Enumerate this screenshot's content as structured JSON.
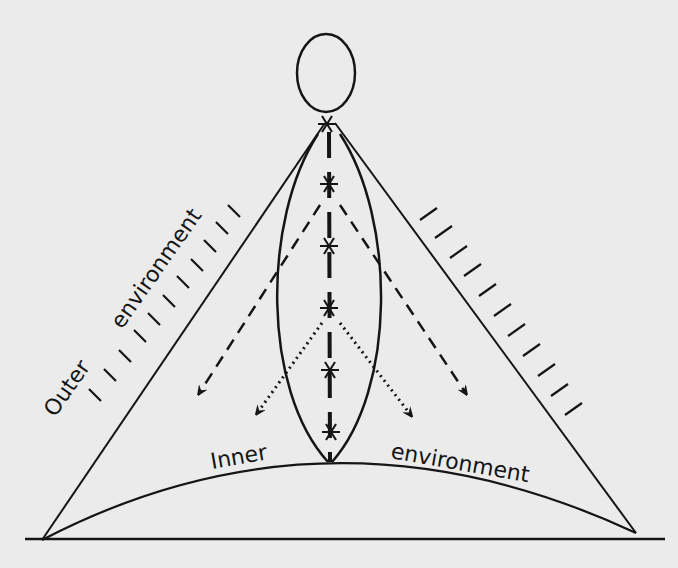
{
  "diagram": {
    "title": "",
    "labels": {
      "outer_word1": "Outer",
      "outer_word2": "environment",
      "inner_word1": "Inner",
      "inner_word2": "environment"
    },
    "elements": {
      "head": "head-ellipse",
      "spine": "vertical-axis-with-7-asterisk-nodes",
      "body": "lens-shaped-inner-body",
      "outer_boundary": "triangle-sides-with-hatching",
      "arrows_dashed": 2,
      "arrows_dotted": 2,
      "asterisk_count": 7,
      "floor": "arc-inner-environment",
      "ground": "horizontal-ground-line"
    },
    "colors": {
      "ink": "#151515",
      "paper": "#ebebeb"
    }
  }
}
